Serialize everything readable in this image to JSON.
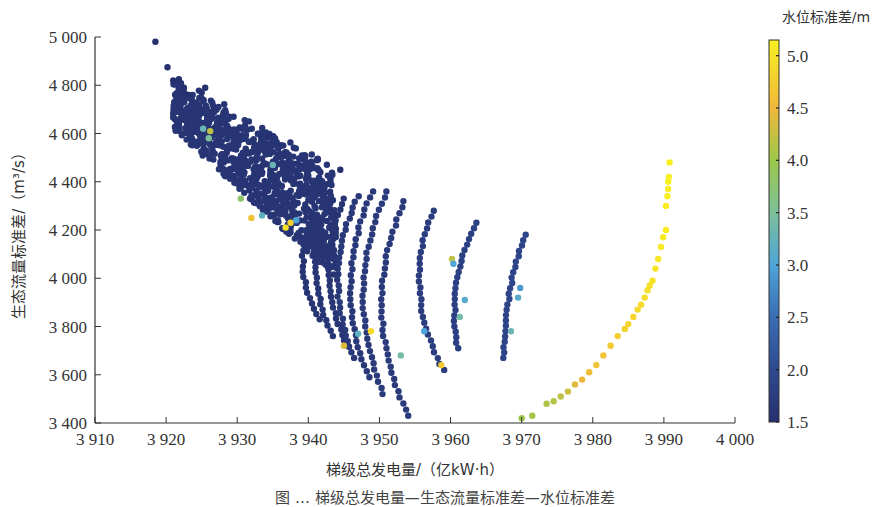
{
  "chart_data": {
    "type": "scatter",
    "title": "",
    "xlabel": "梯级总发电量/（亿kW·h）",
    "ylabel": "生态流量标准差/（m³/s）",
    "xlim": [
      3910,
      4000
    ],
    "ylim": [
      3400,
      5000
    ],
    "xticks": [
      3910,
      3920,
      3930,
      3940,
      3950,
      3960,
      3970,
      3980,
      3990,
      4000
    ],
    "xtick_labels": [
      "3 910",
      "3 920",
      "3 930",
      "3 940",
      "3 950",
      "3 960",
      "3 970",
      "3 980",
      "3 990",
      "4 000"
    ],
    "yticks": [
      3400,
      3600,
      3800,
      4000,
      4200,
      4400,
      4600,
      4800,
      5000
    ],
    "ytick_labels": [
      "3 400",
      "3 600",
      "3 800",
      "4 000",
      "4 200",
      "4 400",
      "4 600",
      "4 800",
      "5 000"
    ],
    "grid": false,
    "colorbar": {
      "title": "水位标准差/m",
      "range": [
        1.5,
        5.15
      ],
      "ticks": [
        1.5,
        2.0,
        2.5,
        3.0,
        3.5,
        4.0,
        4.5,
        5.0
      ],
      "tick_labels": [
        "1.5",
        "2.0",
        "2.5",
        "3.0",
        "3.5",
        "4.0",
        "4.5",
        "5.0"
      ],
      "colormap": "parula",
      "stops": [
        {
          "v": 1.5,
          "color": "#27306e"
        },
        {
          "v": 2.0,
          "color": "#2e4a8f"
        },
        {
          "v": 2.5,
          "color": "#3a6cb4"
        },
        {
          "v": 3.0,
          "color": "#4ea5d8"
        },
        {
          "v": 3.5,
          "color": "#7cc09a"
        },
        {
          "v": 4.0,
          "color": "#9cc84a"
        },
        {
          "v": 4.5,
          "color": "#f0b83a"
        },
        {
          "v": 5.15,
          "color": "#f8f020"
        }
      ]
    },
    "series": [
      {
        "name": "outliers-top",
        "points": [
          [
            3918.5,
            4980,
            1.5
          ],
          [
            3920.2,
            4875,
            1.5
          ],
          [
            3921.0,
            4820,
            1.5
          ],
          [
            3921.8,
            4825,
            1.5
          ],
          [
            3922.5,
            4790,
            1.5
          ],
          [
            3923.2,
            4760,
            1.5
          ],
          [
            3925.0,
            4770,
            1.5
          ],
          [
            3925.5,
            4790,
            1.5
          ],
          [
            3934.5,
            4590,
            1.5
          ],
          [
            3944.5,
            4450,
            1.5
          ]
        ]
      },
      {
        "name": "dense-cluster",
        "region": {
          "x": [
            3921,
            3944
          ],
          "y": [
            3980,
            4800
          ]
        },
        "dominant_value": 1.6,
        "approx_points": 900
      },
      {
        "name": "arc-1",
        "x_top": 3941.0,
        "y_top": 4290,
        "x_bottom": 3941.5,
        "y_bottom": 3830,
        "bulge": 2.0,
        "value": 1.6,
        "n": 22
      },
      {
        "name": "arc-2",
        "x_top": 3943.0,
        "y_top": 4310,
        "x_bottom": 3943.5,
        "y_bottom": 3760,
        "bulge": 2.2,
        "value": 1.6,
        "n": 26
      },
      {
        "name": "arc-3",
        "x_top": 3945.0,
        "y_top": 4330,
        "x_bottom": 3945.5,
        "y_bottom": 3720,
        "bulge": 2.4,
        "value": 1.6,
        "n": 28
      },
      {
        "name": "arc-4",
        "x_top": 3947.0,
        "y_top": 4340,
        "x_bottom": 3946.5,
        "y_bottom": 3670,
        "bulge": 2.6,
        "value": 1.65,
        "n": 30
      },
      {
        "name": "arc-5",
        "x_top": 3949.0,
        "y_top": 4360,
        "x_bottom": 3948.5,
        "y_bottom": 3590,
        "bulge": 2.8,
        "value": 1.65,
        "n": 32
      },
      {
        "name": "arc-6",
        "x_top": 3951.0,
        "y_top": 4360,
        "x_bottom": 3950.5,
        "y_bottom": 3520,
        "bulge": 3.0,
        "value": 1.7,
        "n": 34
      },
      {
        "name": "arc-7",
        "x_top": 3953.5,
        "y_top": 4320,
        "x_bottom": 3954.0,
        "y_bottom": 3430,
        "bulge": 3.4,
        "value": 1.7,
        "n": 36
      },
      {
        "name": "arc-8",
        "x_top": 3957.5,
        "y_top": 4280,
        "x_bottom": 3959.0,
        "y_bottom": 3620,
        "bulge": 2.6,
        "value": 1.75,
        "n": 28
      },
      {
        "name": "arc-9",
        "x_top": 3963.5,
        "y_top": 4230,
        "x_bottom": 3961.0,
        "y_bottom": 3710,
        "bulge": 1.4,
        "value": 1.8,
        "n": 24
      },
      {
        "name": "arc-10",
        "x_top": 3970.5,
        "y_top": 4180,
        "x_bottom": 3967.5,
        "y_bottom": 3670,
        "bulge": 0.8,
        "value": 1.9,
        "n": 24
      },
      {
        "name": "arc-high",
        "points": [
          [
            3970.0,
            3420,
            4.0
          ],
          [
            3971.5,
            3430,
            4.05
          ],
          [
            3973.5,
            3480,
            4.1
          ],
          [
            3974.5,
            3490,
            4.15
          ],
          [
            3975.5,
            3510,
            4.2
          ],
          [
            3976.5,
            3530,
            4.3
          ],
          [
            3977.5,
            3560,
            4.4
          ],
          [
            3978.5,
            3580,
            4.5
          ],
          [
            3979.5,
            3610,
            4.55
          ],
          [
            3980.5,
            3640,
            4.6
          ],
          [
            3981.5,
            3680,
            4.65
          ],
          [
            3982.5,
            3720,
            4.7
          ],
          [
            3983.5,
            3760,
            4.75
          ],
          [
            3984.5,
            3790,
            4.8
          ],
          [
            3985.0,
            3810,
            4.82
          ],
          [
            3985.7,
            3840,
            4.85
          ],
          [
            3986.3,
            3870,
            4.88
          ],
          [
            3986.8,
            3890,
            4.9
          ],
          [
            3987.3,
            3920,
            4.92
          ],
          [
            3987.7,
            3950,
            4.95
          ],
          [
            3988.0,
            3970,
            4.97
          ],
          [
            3988.4,
            3990,
            5.0
          ],
          [
            3988.8,
            4040,
            5.02
          ],
          [
            3989.2,
            4080,
            5.05
          ],
          [
            3989.6,
            4130,
            5.07
          ],
          [
            3989.9,
            4170,
            5.08
          ],
          [
            3990.3,
            4200,
            5.1
          ],
          [
            3990.3,
            4300,
            5.12
          ],
          [
            3990.5,
            4340,
            5.13
          ],
          [
            3990.6,
            4370,
            5.13
          ],
          [
            3990.6,
            4400,
            5.14
          ],
          [
            3990.7,
            4420,
            5.15
          ],
          [
            3990.8,
            4480,
            5.15
          ]
        ]
      },
      {
        "name": "highlighted-mid-values",
        "points": [
          [
            3925.2,
            4620,
            3.3
          ],
          [
            3926.2,
            4610,
            4.2
          ],
          [
            3926.0,
            4580,
            3.5
          ],
          [
            3930.5,
            4330,
            3.8
          ],
          [
            3932.0,
            4250,
            4.6
          ],
          [
            3933.5,
            4260,
            3.2
          ],
          [
            3935.0,
            4470,
            3.3
          ],
          [
            3936.8,
            4210,
            5.0
          ],
          [
            3937.5,
            4230,
            4.8
          ],
          [
            3938.3,
            4240,
            3.0
          ],
          [
            3945.0,
            3720,
            4.4
          ],
          [
            3947.0,
            3770,
            3.2
          ],
          [
            3948.8,
            3780,
            4.9
          ],
          [
            3953.0,
            3680,
            3.4
          ],
          [
            3956.3,
            3780,
            3.0
          ],
          [
            3958.7,
            3640,
            4.7
          ],
          [
            3960.2,
            4080,
            4.2
          ],
          [
            3960.4,
            4060,
            3.0
          ],
          [
            3962.0,
            3910,
            3.1
          ],
          [
            3961.3,
            3840,
            3.4
          ],
          [
            3969.8,
            3960,
            2.9
          ],
          [
            3969.5,
            3920,
            3.1
          ],
          [
            3968.5,
            3780,
            3.3
          ]
        ]
      }
    ]
  },
  "caption": "图 … 梯级总发电量—生态流量标准差—水位标准差"
}
